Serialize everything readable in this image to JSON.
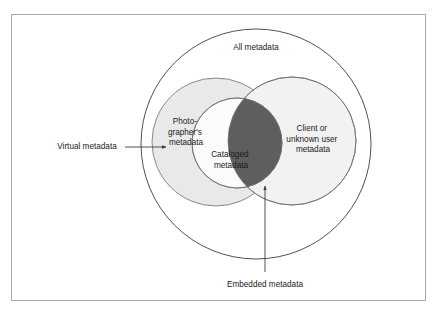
{
  "figure": {
    "type": "venn-diagram",
    "frame": {
      "border_color": "#a9a9ab",
      "background": "#ffffff"
    },
    "colors": {
      "outline": "#3d3d3f",
      "photographer_fill": "#e9e9e9",
      "cataloged_fill": "#fbfbfb",
      "client_fill": "#f2f2f2",
      "overlap_fill": "#5e5e5e",
      "text": "#1b1b1b",
      "arrow": "#3d3d3f"
    },
    "sets": [
      {
        "id": "all-metadata",
        "label": "All metadata",
        "label_lines": [
          "All metadata"
        ],
        "role": "universe"
      },
      {
        "id": "photographers-metadata",
        "label": "Photographer's metadata",
        "label_lines": [
          "Photo-",
          "grapher's",
          "metadata"
        ],
        "role": "left-set"
      },
      {
        "id": "cataloged-metadata",
        "label": "Cataloged metadata",
        "label_lines": [
          "Cataloged",
          "metadata"
        ],
        "role": "inner-set"
      },
      {
        "id": "client-or-unknown-user-metadata",
        "label": "Client or unknown user metadata",
        "label_lines": [
          "Client or",
          "unknown user",
          "metadata"
        ],
        "role": "right-set"
      }
    ],
    "callouts": [
      {
        "id": "virtual-metadata",
        "label": "Virtual metadata",
        "points_to": "photographers-metadata",
        "direction": "right"
      },
      {
        "id": "embedded-metadata",
        "label": "Embedded metadata",
        "points_to": "cataloged-client-overlap",
        "direction": "up"
      }
    ]
  }
}
